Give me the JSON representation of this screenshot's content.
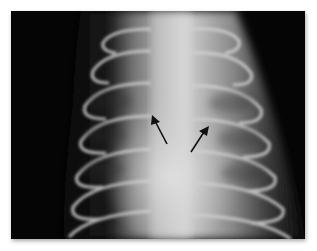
{
  "figure": {
    "type": "radiograph",
    "view": "thoracic x-ray, dorsoventral",
    "annotations": [
      {
        "kind": "arrow",
        "direction": "up-left",
        "tip": [
          152,
          116
        ],
        "tail": [
          167,
          144
        ]
      },
      {
        "kind": "arrow",
        "direction": "up-right",
        "tip": [
          208,
          127
        ],
        "tail": [
          191,
          152
        ]
      }
    ],
    "colors": {
      "background": "#ffffff",
      "film_dark": "#050505",
      "bone": "#d8d8d8",
      "arrow": "#111111"
    }
  }
}
